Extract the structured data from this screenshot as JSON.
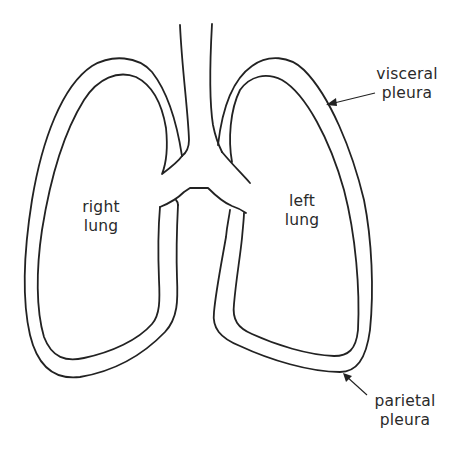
{
  "diagram": {
    "labels": {
      "right_lung": {
        "line1": "right",
        "line2": "lung"
      },
      "left_lung": {
        "line1": "left",
        "line2": "lung"
      },
      "visceral_pleura": {
        "line1": "visceral",
        "line2": "pleura"
      },
      "parietal_pleura": {
        "line1": "parietal",
        "line2": "pleura"
      }
    },
    "structures": [
      "trachea",
      "bronchi",
      "right lung",
      "left lung",
      "visceral pleura",
      "parietal pleura"
    ],
    "colors": {
      "line": "#222222",
      "text": "#2a2a2a",
      "background": "#ffffff"
    }
  }
}
